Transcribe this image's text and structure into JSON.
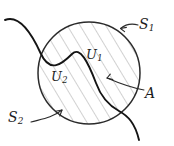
{
  "figure": {
    "labels": {
      "s1": {
        "base": "S",
        "sub": "1"
      },
      "s2": {
        "base": "S",
        "sub": "2"
      },
      "u1": {
        "base": "U",
        "sub": "1"
      },
      "u2": {
        "base": "U",
        "sub": "2"
      },
      "a": {
        "base": "A",
        "sub": ""
      }
    },
    "colors": {
      "background": "#ffffff",
      "ink": "#1c1c1c",
      "circle_stroke": "#2b2b2b",
      "dividing_curve_stroke": "#141414",
      "hatch_stroke": "#9a9a9a",
      "leader_stroke": "#2b2b2b"
    },
    "geometry": {
      "circle": {
        "cx": 89,
        "cy": 73,
        "r": 51
      },
      "hatch_angle_deg": -31,
      "hatch_spacing_px": 11
    }
  }
}
